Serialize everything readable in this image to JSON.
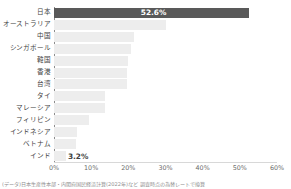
{
  "chart_data": {
    "type": "bar",
    "orientation": "horizontal",
    "title": "",
    "xlabel": "",
    "ylabel": "",
    "xlim": [
      0,
      60
    ],
    "grid": false,
    "legend": null,
    "xtick_labels": [
      "0%",
      "10%",
      "20%",
      "30%",
      "40%",
      "50%",
      "60%"
    ],
    "xtick_values": [
      0,
      10,
      20,
      30,
      40,
      50,
      60
    ],
    "categories": [
      "日本",
      "オーストラリア",
      "中国",
      "シンガポール",
      "韓国",
      "香港",
      "台湾",
      "タイ",
      "マレーシア",
      "フィリピン",
      "インドネシア",
      "ベトナム",
      "インド"
    ],
    "values": [
      52.6,
      30.0,
      21.5,
      20.7,
      20.0,
      19.6,
      19.6,
      13.7,
      13.7,
      9.4,
      6.2,
      5.9,
      3.2
    ],
    "data_labels": [
      "52.6%",
      "",
      "",
      "",
      "",
      "",
      "",
      "",
      "",
      "",
      "",
      "",
      "3.2%"
    ],
    "highlight_index": 0,
    "colors": {
      "highlight_bar": "#595959",
      "bar": "#ededed",
      "axis": "#8c8c8c",
      "text": "#3f3f3f",
      "tick_text": "#6d6d6d",
      "footnote_text": "#8e8e8e",
      "background": "#ffffff"
    }
  },
  "footnote": "(データ)日本生産性本部・内閣府国民経済計算(2022年)など 調査時点の為替レートで換算",
  "topnote": ""
}
